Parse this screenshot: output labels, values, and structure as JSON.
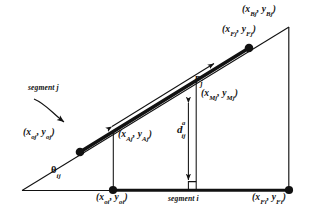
{
  "figure": {
    "type": "geometry-diagram",
    "background_color": "#ffffff",
    "ink_color": "#111111"
  },
  "labels": {
    "point_Bj": {
      "text_x": "x",
      "sub_x": "Bj",
      "text_y": "y",
      "sub_y": "Bj"
    },
    "point_Fj": {
      "text_x": "x",
      "sub_x": "Fj",
      "text_y": "y",
      "sub_y": "Fj"
    },
    "point_Mj": {
      "text_x": "x",
      "sub_x": "Mj",
      "text_y": "y",
      "sub_y": "Mj"
    },
    "point_Aj": {
      "text_x": "x",
      "sub_x": "Aj",
      "text_y": "y",
      "sub_y": "Aj"
    },
    "point_oj": {
      "text_x": "x",
      "sub_x": "oj",
      "text_y": "y",
      "sub_y": "oj"
    },
    "point_oi": {
      "text_x": "x",
      "sub_x": "oi",
      "text_y": "y",
      "sub_y": "oi"
    },
    "point_Fi": {
      "text_x": "x",
      "sub_x": "Fi",
      "text_y": "y",
      "sub_y": "Fi"
    },
    "segment_j": "segment j",
    "segment_i": "segment i",
    "vector_pj": {
      "symbol": "p",
      "subscript": "j"
    },
    "angle_theta": {
      "symbol": "θ",
      "subscript": "ij"
    },
    "distance_d": {
      "symbol": "d",
      "superscript": "a",
      "subscript": "ij"
    }
  },
  "geometry": {
    "segment_i": {
      "x1": 113,
      "y1": 190,
      "x2": 289,
      "y2": 190
    },
    "segment_j": {
      "x1": 80,
      "y1": 152,
      "x2": 249,
      "y2": 48
    },
    "baseline_extension": {
      "x1": 22,
      "y1": 190,
      "x2": 113,
      "y2": 190
    },
    "hypotenuse_extension": {
      "x1": 22,
      "y1": 190,
      "x2": 289,
      "y2": 27
    },
    "right_vertical": {
      "x1": 289,
      "y1": 27,
      "x2": 289,
      "y2": 190
    },
    "drop_A": {
      "x1": 113,
      "y1": 133,
      "x2": 113,
      "y2": 190
    },
    "drop_M": {
      "x1": 196,
      "y1": 82,
      "x2": 196,
      "y2": 190
    },
    "distance_arrow": {
      "x1": 188,
      "y1": 102,
      "x2": 188,
      "y2": 182
    },
    "pj_arrow": {
      "x1": 111,
      "y1": 127,
      "x2": 215,
      "y2": 63
    },
    "pointer_arrow": {
      "x1": 36,
      "y1": 100,
      "x2": 78,
      "y2": 128
    },
    "nodes": [
      {
        "name": "node-oj",
        "cx": 80,
        "cy": 152
      },
      {
        "name": "node-Bj",
        "cx": 249,
        "cy": 48
      },
      {
        "name": "node-oi",
        "cx": 113,
        "cy": 190
      },
      {
        "name": "node-Fi",
        "cx": 289,
        "cy": 190
      }
    ]
  }
}
